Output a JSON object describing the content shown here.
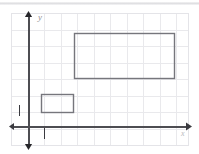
{
  "figure": {
    "width": 199,
    "height": 154,
    "background_color": "#ffffff"
  },
  "grid": {
    "visible": true,
    "color": "#e9e9ec",
    "spacing_px": 16.5,
    "box": {
      "left": 11,
      "top": 13,
      "right": 189,
      "bottom": 146
    }
  },
  "axes": {
    "color": "#4d4d52",
    "origin": {
      "x": 28,
      "y": 126
    },
    "x_axis": {
      "label": "x",
      "arrow_start": true,
      "arrow_end": true,
      "from_x": 14,
      "to_x": 186,
      "y": 126
    },
    "y_axis": {
      "label": "y",
      "arrow_start": true,
      "arrow_end": true,
      "from_y": 144,
      "to_y": 17,
      "x": 28
    }
  },
  "unit_marks": [
    {
      "name": "y-unit-tick",
      "label": "1",
      "x": 19,
      "y_top": 105,
      "y_bottom": 116
    },
    {
      "name": "x-unit-tick",
      "label": "1",
      "x": 44,
      "y_top": 128,
      "y_bottom": 139
    }
  ],
  "shapes": [
    {
      "name": "large-rectangle",
      "type": "rectangle",
      "stroke_color": "#76767c",
      "fill": "none",
      "x": 74,
      "y": 33,
      "width": 100,
      "height": 45
    },
    {
      "name": "small-rectangle",
      "type": "rectangle",
      "stroke_color": "#76767c",
      "fill": "none",
      "x": 41,
      "y": 94,
      "width": 32,
      "height": 18
    }
  ]
}
